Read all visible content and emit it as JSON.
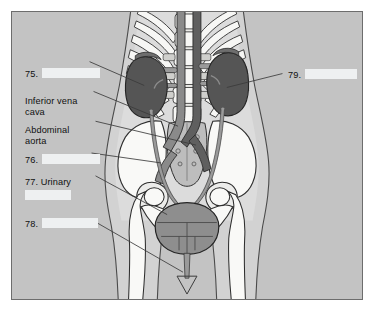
{
  "figure": {
    "frame_border_color": "#6d6d6d",
    "background_color": "#c3c3c3",
    "blank_fill_color": "#eef0f1",
    "leader_line_color": "#3a3a3a"
  },
  "labels": {
    "l75": {
      "number": "75.",
      "text": "",
      "blank": true
    },
    "ivc": {
      "line1": "Inferior vena",
      "line2": "cava"
    },
    "aorta": {
      "line1": "Abdominal",
      "line2": "aorta"
    },
    "l76": {
      "number": "76.",
      "text": "",
      "blank": true
    },
    "l77": {
      "number": "77. Urinary",
      "text": "",
      "blank": true
    },
    "l78": {
      "number": "78.",
      "text": "",
      "blank": true
    },
    "l79": {
      "number": "79.",
      "text": "",
      "blank": true
    }
  },
  "anatomy": {
    "colors": {
      "body_silhouette": "#d2d2d2",
      "body_inner": "#dcdcdc",
      "bone": "#f7f7f5",
      "bone_outline": "#2e2e2e",
      "kidney": "#555555",
      "vessel_dark": "#5f5f5f",
      "vessel_mid": "#8a8a8a",
      "ureter": "#9a9a9a",
      "bladder": "#8e8e8e",
      "sacrum": "#bdbdbd"
    },
    "structures": [
      "kidney-left",
      "kidney-right",
      "inferior-vena-cava",
      "abdominal-aorta",
      "ureter-left",
      "ureter-right",
      "urinary-bladder",
      "urethra",
      "ribcage",
      "lumbar-spine",
      "pelvis",
      "sacrum",
      "femur-left",
      "femur-right"
    ]
  }
}
